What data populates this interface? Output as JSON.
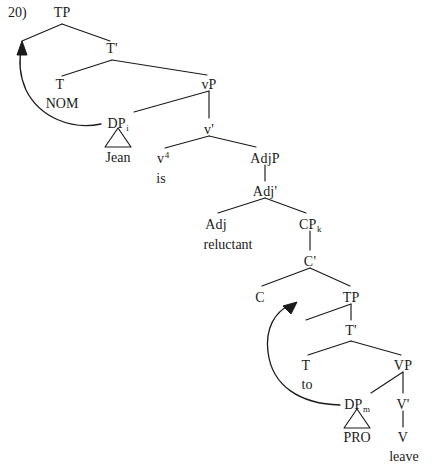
{
  "figure": {
    "example_number": "20)",
    "type": "syntax-tree",
    "ink_color": "#1a1a1a",
    "background": "#ffffff"
  },
  "nodes": {
    "tp_root": {
      "label": "TP",
      "x": 62,
      "y": 6
    },
    "tbar_main": {
      "label": "T'",
      "x": 112,
      "y": 42
    },
    "t_main": {
      "label": "T",
      "x": 60,
      "y": 78
    },
    "t_main_feature": {
      "label": "NOM",
      "x": 62,
      "y": 97
    },
    "vp": {
      "label": "vP",
      "x": 209,
      "y": 78
    },
    "dp_i": {
      "label": "DP",
      "sub": "i",
      "x": 118,
      "y": 117
    },
    "dp_i_word": {
      "label": "Jean",
      "x": 118,
      "y": 151
    },
    "vbar": {
      "label": "v'",
      "x": 209,
      "y": 123
    },
    "little_v": {
      "label": "v",
      "sup": "4",
      "x": 163,
      "y": 152
    },
    "little_v_word": {
      "label": "is",
      "x": 161,
      "y": 172
    },
    "adjp": {
      "label": "AdjP",
      "x": 265,
      "y": 152
    },
    "adjbar": {
      "label": "Adj'",
      "x": 265,
      "y": 185
    },
    "adj": {
      "label": "Adj",
      "x": 216,
      "y": 218
    },
    "adj_word": {
      "label": "reluctant",
      "x": 228,
      "y": 238
    },
    "cp_k": {
      "label": "CP",
      "sub": "k",
      "x": 310,
      "y": 218
    },
    "cbar": {
      "label": "C'",
      "x": 310,
      "y": 255
    },
    "c_head": {
      "label": "C",
      "x": 260,
      "y": 291
    },
    "tp_embedded": {
      "label": "TP",
      "x": 351,
      "y": 291
    },
    "tbar_embedded": {
      "label": "T'",
      "x": 351,
      "y": 324
    },
    "t_embedded": {
      "label": "T",
      "x": 306,
      "y": 359
    },
    "t_embedded_word": {
      "label": "to",
      "x": 307,
      "y": 378
    },
    "vp_lower": {
      "label": "VP",
      "x": 403,
      "y": 359
    },
    "dp_m": {
      "label": "DP",
      "sub": "m",
      "x": 357,
      "y": 398
    },
    "dp_m_word": {
      "label": "PRO",
      "x": 357,
      "y": 431
    },
    "vbar_lower": {
      "label": "V'",
      "x": 403,
      "y": 398
    },
    "v_lower": {
      "label": "V",
      "x": 403,
      "y": 431
    },
    "v_lower_word": {
      "label": "leave",
      "x": 404,
      "y": 450
    }
  },
  "branches": [
    {
      "name": "tp-to-spec",
      "d": "M 62 24 L 22 41"
    },
    {
      "name": "tp-to-tbar",
      "d": "M 62 24 L 110 41"
    },
    {
      "name": "tbar-to-t",
      "d": "M 112 60 L 62 76"
    },
    {
      "name": "tbar-to-vp",
      "d": "M 112 60 L 207 75"
    },
    {
      "name": "vp-to-dp",
      "d": "M 209 91 L 134 112"
    },
    {
      "name": "vp-to-vbar",
      "d": "M 209 91 L 209 118"
    },
    {
      "name": "vbar-to-v",
      "d": "M 209 136 L 165 148"
    },
    {
      "name": "vbar-to-adjp",
      "d": "M 209 136 L 256 147"
    },
    {
      "name": "adjp-to-adjbar",
      "d": "M 265 165 L 265 181"
    },
    {
      "name": "adjbar-to-adj",
      "d": "M 265 198 L 218 213"
    },
    {
      "name": "adjbar-to-cpk",
      "d": "M 265 198 L 306 213"
    },
    {
      "name": "cpk-to-cbar",
      "d": "M 310 231 L 310 250"
    },
    {
      "name": "cbar-to-c",
      "d": "M 310 268 L 262 286"
    },
    {
      "name": "cbar-to-tp",
      "d": "M 310 268 L 350 286"
    },
    {
      "name": "tp-embedded-to-spec",
      "d": "M 351 304 L 306 320"
    },
    {
      "name": "tp-embedded-to-tbar",
      "d": "M 351 304 L 351 320"
    },
    {
      "name": "tbar-embedded-to-t",
      "d": "M 351 341 L 308 355"
    },
    {
      "name": "tbar-embedded-to-vp",
      "d": "M 351 341 L 401 355"
    },
    {
      "name": "vp-lower-to-dp",
      "d": "M 403 372 L 371 393"
    },
    {
      "name": "vp-lower-to-vbar",
      "d": "M 403 372 L 403 393"
    },
    {
      "name": "vbar-lower-to-v",
      "d": "M 403 411 L 403 427"
    }
  ],
  "triangles": [
    {
      "name": "dp-i-triangle",
      "points": "118,128 105,147 131,147"
    },
    {
      "name": "dp-m-triangle",
      "points": "357,409 344,428 370,428"
    }
  ],
  "movement_arrows": [
    {
      "name": "upper-movement-arrow",
      "from": "DP_i",
      "to": "Spec,TP",
      "d": "M 101 124 C 72 130 40 118 26 90 C 18 72 19 58 22 46"
    },
    {
      "name": "lower-movement-arrow",
      "from": "DP_m",
      "to": "Spec,TP (embedded)",
      "d": "M 340 405 C 300 404 272 386 268 352 C 265 328 275 312 290 305"
    }
  ],
  "arrow_heads": [
    {
      "name": "upper-arrow-head",
      "points": "22,41 17,55 27,55"
    },
    {
      "name": "lower-arrow-head",
      "points": "297,302 283,306 291,314"
    }
  ]
}
